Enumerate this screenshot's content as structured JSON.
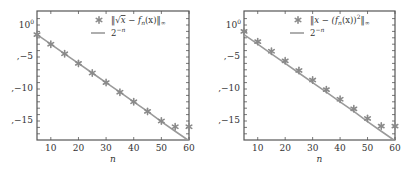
{
  "chart_data": [
    {
      "type": "scatter",
      "title": "",
      "xlabel": "n",
      "ylabel": "",
      "yscale": "log",
      "xlim": [
        5,
        60
      ],
      "ylim_log10": [
        -18,
        1.5
      ],
      "x_ticks": [
        "10",
        "20",
        "30",
        "40",
        "50",
        "60"
      ],
      "y_ticks": [
        "10^0",
        "-5",
        "-10",
        "-15"
      ],
      "legend_position": "upper right",
      "grid": false,
      "x": [
        5,
        10,
        15,
        20,
        25,
        30,
        35,
        40,
        45,
        50,
        55,
        60
      ],
      "series": [
        {
          "name": "‖√x − fₙ(x)‖∞",
          "style": "marker-asterisk",
          "log10_values": [
            -1.5,
            -3.0,
            -4.5,
            -6.0,
            -7.5,
            -9.0,
            -10.5,
            -12.0,
            -13.5,
            -15.0,
            -15.9,
            -15.9
          ]
        },
        {
          "name": "2⁻ⁿ",
          "style": "line",
          "log10_values": [
            -1.5,
            -3.0,
            -4.5,
            -6.0,
            -7.5,
            -9.0,
            -10.5,
            -12.0,
            -13.5,
            -15.1,
            -16.6,
            -18.1
          ]
        }
      ]
    },
    {
      "type": "scatter",
      "title": "",
      "xlabel": "n",
      "ylabel": "",
      "yscale": "log",
      "xlim": [
        5,
        60
      ],
      "ylim_log10": [
        -18,
        1.5
      ],
      "x_ticks": [
        "10",
        "20",
        "30",
        "40",
        "50",
        "60"
      ],
      "y_ticks": [
        "10^0",
        "-5",
        "-10",
        "-15"
      ],
      "legend_position": "upper right",
      "grid": false,
      "x": [
        5,
        10,
        15,
        20,
        25,
        30,
        35,
        40,
        45,
        50,
        55,
        60
      ],
      "series": [
        {
          "name": "‖x − (fₙ(x))²‖∞",
          "style": "marker-asterisk",
          "log10_values": [
            -1.0,
            -2.6,
            -4.1,
            -5.6,
            -7.1,
            -8.6,
            -10.1,
            -11.6,
            -13.1,
            -14.6,
            -15.8,
            -15.8
          ]
        },
        {
          "name": "2⁻ⁿ",
          "style": "line",
          "log10_values": [
            -1.5,
            -3.0,
            -4.5,
            -6.0,
            -7.5,
            -9.0,
            -10.5,
            -12.0,
            -13.5,
            -15.1,
            -16.6,
            -18.1
          ]
        }
      ]
    }
  ],
  "colors": {
    "marker": "#8a8a8a",
    "line": "#9a9a9a",
    "axis": "#555555",
    "text": "#333333"
  },
  "panels": [
    {
      "legend": {
        "marker_label_parts": [
          "‖",
          "√",
          "x",
          " − f",
          "n",
          "(x)‖",
          "∞"
        ],
        "line_label_base": "2",
        "line_label_exp": "−n"
      },
      "ytick_labels": {
        "top_base": "10",
        "top_exp": "0",
        "m5": ",−5",
        "m10": ",−10",
        "m15": ",−15"
      },
      "xtick_labels": [
        "10",
        "20",
        "30",
        "40",
        "50",
        "60"
      ],
      "xlabel": "n"
    },
    {
      "legend": {
        "marker_label_parts": [
          "‖x − (f",
          "n",
          "(x))",
          "2",
          "‖",
          "∞"
        ],
        "line_label_base": "2",
        "line_label_exp": "−n"
      },
      "ytick_labels": {
        "top_base": "10",
        "top_exp": "0",
        "m5": ",−5",
        "m10": ",−10",
        "m15": ",−15"
      },
      "xtick_labels": [
        "10",
        "20",
        "30",
        "40",
        "50",
        "60"
      ],
      "xlabel": "n"
    }
  ]
}
